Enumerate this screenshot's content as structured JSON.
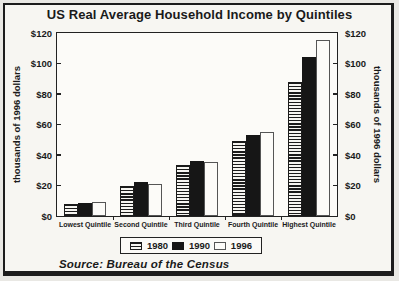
{
  "colors": {
    "ink": "#1a1a1a",
    "paper": "#f7f6f2"
  },
  "chart_data": {
    "type": "bar",
    "title": "US Real Average Household Income by Quintiles",
    "categories": [
      "Lowest Quintile",
      "Second Quintile",
      "Third Quintile",
      "Fourth Quintile",
      "Highest Quintile"
    ],
    "series": [
      {
        "name": "1980",
        "pattern": "horizontal-stripes",
        "values": [
          8,
          20,
          33.5,
          49.5,
          88
        ]
      },
      {
        "name": "1990",
        "pattern": "solid-black",
        "values": [
          8.5,
          22,
          36,
          53,
          104
        ]
      },
      {
        "name": "1996",
        "pattern": "white-outline",
        "values": [
          9,
          21,
          35.5,
          55,
          115.5
        ]
      }
    ],
    "ylabel_left": "thousands of 1996 dollars",
    "ylabel_right": "thousands of 1996 dollars",
    "ylim": [
      0,
      120
    ],
    "yticks": [
      {
        "value": 120,
        "label": "$120"
      },
      {
        "value": 100,
        "label": "$100"
      },
      {
        "value": 80,
        "label": "$80"
      },
      {
        "value": 60,
        "label": "$60"
      },
      {
        "value": 40,
        "label": "$40"
      },
      {
        "value": 20,
        "label": "$20"
      },
      {
        "value": 0,
        "label": "$0"
      }
    ],
    "grid": false,
    "legend_position": "bottom",
    "source": "Source: Bureau of the Census"
  }
}
